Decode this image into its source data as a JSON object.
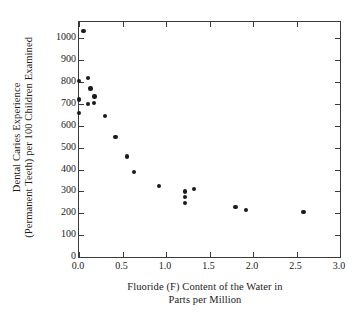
{
  "chart_data": {
    "type": "scatter",
    "title": "",
    "xlabel_lines": [
      "Fluoride (F) Content of the Water in",
      "Parts per Million"
    ],
    "xlabel": "Fluoride (F) Content of the Water in Parts per Million",
    "ylabel_lines": [
      "Dental Caries Experience",
      "(Permanent Teeth) per 100 Children Examined"
    ],
    "ylabel": "Dental Caries Experience (Permanent Teeth) per 100 Children Examined",
    "xlim": [
      0.0,
      3.0
    ],
    "ylim": [
      0,
      1075
    ],
    "xticks": [
      0.0,
      0.5,
      1.0,
      1.5,
      2.0,
      2.5,
      3.0
    ],
    "xtick_labels": [
      "0.0",
      "0.5",
      "1.0",
      "1.5",
      "2.0",
      "2.5",
      "3.0"
    ],
    "yticks": [
      0,
      100,
      200,
      300,
      400,
      500,
      600,
      700,
      800,
      900,
      1000
    ],
    "ytick_labels": [
      "0",
      "100",
      "200",
      "300",
      "400",
      "500",
      "600",
      "700",
      "800",
      "900",
      "1000"
    ],
    "grid": false,
    "legend": null,
    "marker_color": "#1b1b1b",
    "axis_color": "#3a3a3a",
    "points": [
      {
        "x": 0.05,
        "y": 1035
      },
      {
        "x": 0.0,
        "y": 805
      },
      {
        "x": 0.1,
        "y": 820
      },
      {
        "x": 0.13,
        "y": 770
      },
      {
        "x": 0.0,
        "y": 720
      },
      {
        "x": 0.18,
        "y": 735
      },
      {
        "x": 0.1,
        "y": 700
      },
      {
        "x": 0.17,
        "y": 705
      },
      {
        "x": 0.0,
        "y": 660
      },
      {
        "x": 0.3,
        "y": 645
      },
      {
        "x": 0.42,
        "y": 550
      },
      {
        "x": 0.55,
        "y": 460
      },
      {
        "x": 0.63,
        "y": 390
      },
      {
        "x": 0.92,
        "y": 325
      },
      {
        "x": 1.22,
        "y": 300
      },
      {
        "x": 1.32,
        "y": 310
      },
      {
        "x": 1.22,
        "y": 275
      },
      {
        "x": 1.22,
        "y": 248
      },
      {
        "x": 1.8,
        "y": 228
      },
      {
        "x": 1.92,
        "y": 215
      },
      {
        "x": 2.58,
        "y": 205
      }
    ]
  }
}
